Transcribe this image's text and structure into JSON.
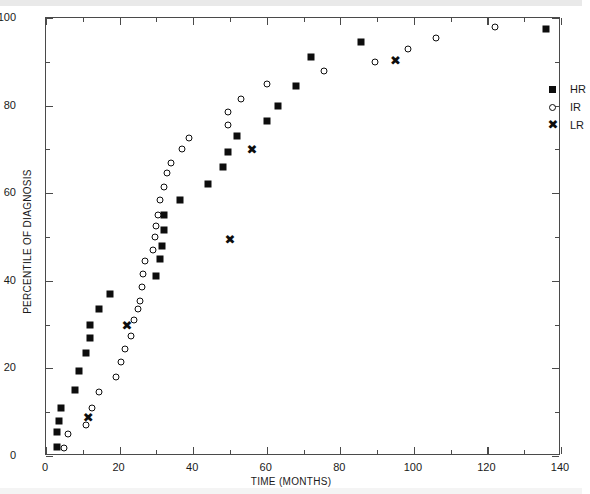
{
  "chart_data": {
    "type": "scatter",
    "title": "",
    "xlabel": "TIME (MONTHS)",
    "ylabel": "PERCENTILE OF DIAGNOSIS",
    "xlim": [
      0,
      140
    ],
    "ylim": [
      0,
      100
    ],
    "xticks": [
      0,
      20,
      40,
      60,
      80,
      100,
      120,
      140
    ],
    "yticks": [
      0,
      20,
      40,
      60,
      80,
      100
    ],
    "xminor_step": 10,
    "yminor_step": 10,
    "grid": false,
    "legend_position": "upper-right-inside",
    "series": [
      {
        "name": "HR",
        "marker": "filled-square",
        "color": "#0d0d0d",
        "points": [
          [
            3,
            2
          ],
          [
            3,
            5.5
          ],
          [
            3.5,
            8
          ],
          [
            4,
            11
          ],
          [
            8,
            15
          ],
          [
            9,
            19.5
          ],
          [
            11,
            23.5
          ],
          [
            12,
            27
          ],
          [
            12,
            30
          ],
          [
            14.5,
            33.5
          ],
          [
            17.5,
            37
          ],
          [
            30,
            41
          ],
          [
            31,
            45
          ],
          [
            31.5,
            48
          ],
          [
            32,
            51.5
          ],
          [
            32,
            55
          ],
          [
            36.5,
            58.5
          ],
          [
            44,
            62
          ],
          [
            48,
            66
          ],
          [
            49.5,
            69.5
          ],
          [
            52,
            73
          ],
          [
            60,
            76.5
          ],
          [
            63,
            80
          ],
          [
            68,
            84.5
          ],
          [
            72,
            91
          ],
          [
            85.5,
            94.5
          ],
          [
            136,
            97.5
          ]
        ]
      },
      {
        "name": "IR",
        "marker": "open-circle",
        "color": "#0d0d0d",
        "points": [
          [
            5,
            1.8
          ],
          [
            6,
            5
          ],
          [
            11,
            7
          ],
          [
            12.5,
            11
          ],
          [
            14.5,
            14.5
          ],
          [
            19,
            18
          ],
          [
            20.5,
            21.5
          ],
          [
            21.5,
            24.5
          ],
          [
            23,
            27.5
          ],
          [
            24,
            31
          ],
          [
            25,
            33.5
          ],
          [
            25.5,
            35.5
          ],
          [
            26,
            38.5
          ],
          [
            26.5,
            41.5
          ],
          [
            27,
            44.5
          ],
          [
            29,
            47
          ],
          [
            29.5,
            50
          ],
          [
            30,
            52.5
          ],
          [
            30.5,
            55
          ],
          [
            31,
            58.5
          ],
          [
            32,
            61.5
          ],
          [
            33,
            64.5
          ],
          [
            34,
            67
          ],
          [
            37,
            70
          ],
          [
            39,
            72.5
          ],
          [
            49.5,
            75.5
          ],
          [
            49.5,
            78.5
          ],
          [
            53,
            81.5
          ],
          [
            60,
            85
          ],
          [
            75.5,
            88
          ],
          [
            89.5,
            90
          ],
          [
            98.5,
            93
          ],
          [
            106,
            95.5
          ],
          [
            122,
            98
          ]
        ]
      },
      {
        "name": "LR",
        "marker": "x",
        "color": "#0d0d0d",
        "points": [
          [
            11.5,
            9
          ],
          [
            22,
            30
          ],
          [
            50,
            49.5
          ],
          [
            56,
            70
          ],
          [
            95,
            90.5
          ]
        ]
      }
    ]
  },
  "axes": {
    "x_title": "TIME (MONTHS)",
    "y_title": "PERCENTILE OF DIAGNOSIS",
    "x_tick_labels": [
      "0",
      "20",
      "40",
      "60",
      "80",
      "100",
      "120",
      "140"
    ],
    "y_tick_labels": [
      "0",
      "20",
      "40",
      "60",
      "80",
      "100"
    ]
  },
  "legend": {
    "entries": [
      {
        "label": "HR",
        "symbol": "filled-square-icon"
      },
      {
        "label": "IR",
        "symbol": "open-circle-icon"
      },
      {
        "label": "LR",
        "symbol": "x-marker-icon"
      }
    ]
  }
}
